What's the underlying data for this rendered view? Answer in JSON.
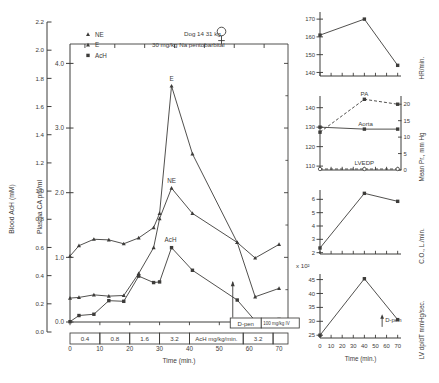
{
  "figure": {
    "annotation_subject": "Dog 14   31 kg",
    "annotation_sex_symbol": "♀",
    "annotation_anesthetic": "30 mg/kg Na pentobarbital",
    "time_axis_label": "Time (min.)",
    "dpen_box_label": "D-pen",
    "dpen_dose_label": "100 mg/kg IV",
    "dose_bar_unit": "AcH mg/kg/min.",
    "dose_bar_segments": [
      "0.4",
      "0.8",
      "1.6",
      "3.2",
      "3.2"
    ],
    "exponent_label": "x 10²"
  },
  "chart_data": [
    {
      "id": "main",
      "type": "line",
      "title": "",
      "xlabel": "Time (min.)",
      "ylabel": "Plasma CA pm/ml",
      "ylabel2": "Blood AcH (mM)",
      "xlim": [
        0,
        73
      ],
      "ylim": [
        0,
        4.3
      ],
      "ylim2": [
        0.0,
        2.2
      ],
      "xticks": [
        0,
        10,
        20,
        30,
        40,
        50,
        60,
        70
      ],
      "xticklabels": [
        "0",
        "10",
        "20",
        "30",
        "40",
        "50",
        "60",
        "70"
      ],
      "yticks": [
        0.0,
        1.0,
        2.0,
        3.0,
        4.0
      ],
      "yticklabels": [
        "0.0",
        "1.0",
        "2.0",
        "3.0",
        "4.0"
      ],
      "yticks2": [
        0.0,
        0.2,
        0.4,
        0.6,
        0.8,
        1.0,
        1.2,
        1.4,
        1.6,
        1.8,
        2.0,
        2.2
      ],
      "yticklabels2": [
        "0.0",
        "0.2",
        "0.4",
        "0.6",
        "0.8",
        "1.0",
        "1.2",
        "1.4",
        "1.6",
        "1.8",
        "2.0",
        "2.2"
      ],
      "grid": false,
      "legend": [
        "NE",
        "E",
        "AcH"
      ],
      "legend_position": "upper-left",
      "annotations": [
        "E",
        "NE",
        "AcH"
      ],
      "series": [
        {
          "name": "E",
          "marker": "triangle",
          "label": "E",
          "x": [
            0,
            3,
            8,
            13,
            18,
            23,
            28,
            30,
            34,
            41,
            56,
            62,
            70
          ],
          "y": [
            1.02,
            1.18,
            1.28,
            1.27,
            1.21,
            1.3,
            1.46,
            1.68,
            3.65,
            2.6,
            1.23,
            0.99,
            1.2
          ]
        },
        {
          "name": "NE",
          "marker": "triangle",
          "label": "NE",
          "x": [
            0,
            3,
            8,
            13,
            18,
            23,
            28,
            30,
            34,
            41,
            56,
            62,
            70
          ],
          "y": [
            0.37,
            0.38,
            0.42,
            0.4,
            0.41,
            0.75,
            1.15,
            1.6,
            2.07,
            1.68,
            1.23,
            0.39,
            0.52
          ]
        },
        {
          "name": "AcH",
          "marker": "square",
          "label": "AcH",
          "x": [
            0,
            3,
            8,
            13,
            18,
            23,
            28,
            30,
            34,
            41,
            56,
            62,
            70
          ],
          "y": [
            0.005,
            0.1,
            0.12,
            0.33,
            0.32,
            0.71,
            0.61,
            0.62,
            1.15,
            0.8,
            0.34,
            0.02,
            0.04
          ]
        }
      ]
    },
    {
      "id": "hr",
      "type": "line",
      "ylabel": "HR/min.",
      "xlim": [
        0,
        73
      ],
      "ylim": [
        138,
        174
      ],
      "yticks": [
        140,
        150,
        160,
        170
      ],
      "yticklabels": [
        "140",
        "150",
        "160",
        "170"
      ],
      "xticks": [
        0,
        10,
        20,
        30,
        40,
        50,
        60,
        70
      ],
      "grid": false,
      "series": [
        {
          "name": "HR",
          "marker": "square",
          "x": [
            0,
            40,
            70
          ],
          "y": [
            161,
            170,
            144
          ]
        }
      ]
    },
    {
      "id": "pressure",
      "type": "line",
      "ylabel": "Mean Pr., mm Hg",
      "xlim": [
        0,
        73
      ],
      "ylim": [
        108,
        146
      ],
      "yticks": [
        110,
        120,
        130,
        140
      ],
      "yticklabels": [
        "110",
        "120",
        "130",
        "140"
      ],
      "yticks_right": [
        0,
        5,
        10,
        15,
        20
      ],
      "yticklabels_right": [
        "0",
        "5",
        "10",
        "15",
        "20"
      ],
      "xticks": [
        0,
        10,
        20,
        30,
        40,
        50,
        60,
        70
      ],
      "grid": false,
      "annotations": [
        "PA",
        "Aorta",
        "LVEDP"
      ],
      "series": [
        {
          "name": "PA",
          "marker": "square",
          "style": "dashed",
          "axis": "right",
          "label": "PA",
          "x": [
            0,
            40,
            70
          ],
          "y": [
            11.5,
            21.5,
            20.0
          ]
        },
        {
          "name": "Aorta",
          "marker": "square",
          "style": "solid",
          "axis": "left",
          "label": "Aorta",
          "x": [
            0,
            40,
            70
          ],
          "y": [
            130,
            129,
            129
          ]
        },
        {
          "name": "LVEDP",
          "marker": "circle-open",
          "style": "dashed",
          "axis": "right",
          "label": "LVEDP",
          "x": [
            0,
            40,
            70
          ],
          "y": [
            0.3,
            0.3,
            0.3
          ]
        }
      ]
    },
    {
      "id": "co",
      "type": "line",
      "ylabel": "C.O., L./min.",
      "xlim": [
        0,
        73
      ],
      "ylim": [
        1.9,
        6.7
      ],
      "yticks": [
        2,
        3,
        4,
        5,
        6
      ],
      "yticklabels": [
        "2",
        "3",
        "4",
        "5",
        "6"
      ],
      "xticks": [
        0,
        10,
        20,
        30,
        40,
        50,
        60,
        70
      ],
      "grid": false,
      "series": [
        {
          "name": "C.O.",
          "marker": "square",
          "x": [
            0,
            40,
            70
          ],
          "y": [
            2.35,
            6.45,
            5.85
          ]
        }
      ]
    },
    {
      "id": "dpdt",
      "type": "line",
      "ylabel": "LV dp/dT mmHg/sec.",
      "xlabel": "Time (min.)",
      "xlim": [
        0,
        73
      ],
      "ylim": [
        24,
        47
      ],
      "yticks": [
        25,
        30,
        35,
        40,
        45
      ],
      "yticklabels": [
        "25",
        "30",
        "35",
        "40",
        "45"
      ],
      "xticks": [
        0,
        10,
        20,
        30,
        40,
        50,
        60,
        70
      ],
      "xticklabels": [
        "0",
        "10",
        "20",
        "30",
        "40",
        "50",
        "60",
        "70"
      ],
      "grid": false,
      "exponent": "x 10²",
      "annotations": [
        "D-pen"
      ],
      "series": [
        {
          "name": "LV dp/dT",
          "marker": "square",
          "x": [
            0,
            40,
            70
          ],
          "y": [
            25.0,
            45.3,
            30.6
          ]
        }
      ]
    }
  ]
}
